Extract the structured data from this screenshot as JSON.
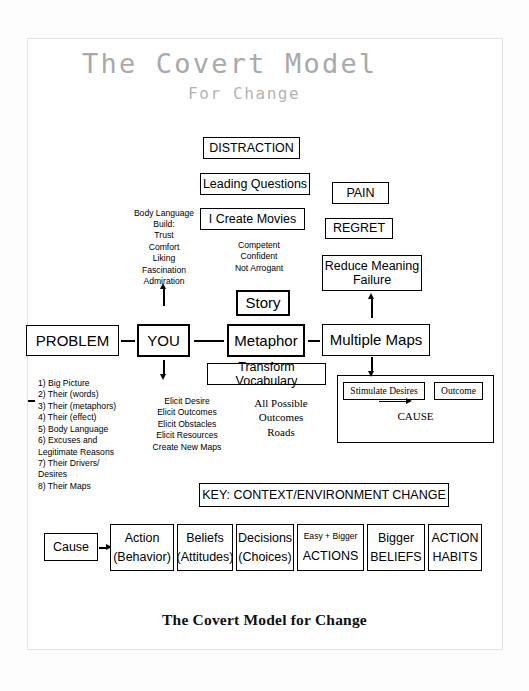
{
  "document": {
    "title_line1": "The Covert Model",
    "title_line2": "For Change",
    "footer_caption": "The Covert Model for Change"
  },
  "top_stack": {
    "distraction": "DISTRACTION",
    "leading_questions": "Leading Questions",
    "i_create_movies": "I Create Movies"
  },
  "right_stack": {
    "pain": "PAIN",
    "regret": "REGRET",
    "reduce_meaning_failure": "Reduce Meaning\nFailure"
  },
  "rapport_list": {
    "heading": "Body Language",
    "items": "Build:\nTrust\nComfort\nLiking\nFascination\nAdmiration"
  },
  "state_list": {
    "lines": "Competent\nConfident\nNot Arrogant"
  },
  "main_row": {
    "problem": "PROBLEM",
    "you": "YOU",
    "metaphor": "Metaphor",
    "multiple_maps": "Multiple Maps",
    "story": "Story",
    "transform_vocabulary": "Transform Vocabulary",
    "connector": "—"
  },
  "discovery_list": {
    "lines": "1) Big Picture\n2) Their  (words)\n3) Their (metaphors)\n4) Their (effect)\n5) Body Language\n6) Excuses and\nLegitimate Reasons\n7) Their Drivers/\nDesires\n8) Their Maps",
    "marker": "—"
  },
  "elicit_list": {
    "lines": "Elicit Desire\nElicit Outcomes\nElicit Obstacles\nElicit Resources\nCreate New Maps"
  },
  "possibility_list": {
    "lines": "All Possible\nOutcomes\nRoads"
  },
  "cause_group": {
    "stimulate_desires": "Stimulate Desires",
    "outcome": "Outcome",
    "cause_label": "CAUSE"
  },
  "key_banner": {
    "label": "KEY: CONTEXT/ENVIRONMENT CHANGE"
  },
  "bottom_row": {
    "cause": "Cause",
    "cells": [
      {
        "top": "Action",
        "bottom": "(Behavior)"
      },
      {
        "top": "Beliefs",
        "bottom": "(Attitudes)"
      },
      {
        "top": "Decisions",
        "bottom": "(Choices)"
      },
      {
        "top": "Easy + Bigger",
        "bottom": "ACTIONS"
      },
      {
        "top": "Bigger",
        "bottom": "BELIEFS"
      },
      {
        "top": "ACTION",
        "bottom": "HABITS"
      }
    ]
  },
  "colors": {
    "ink": "#000000",
    "title_gray": "#a9a9a9",
    "page": "#ffffff"
  }
}
